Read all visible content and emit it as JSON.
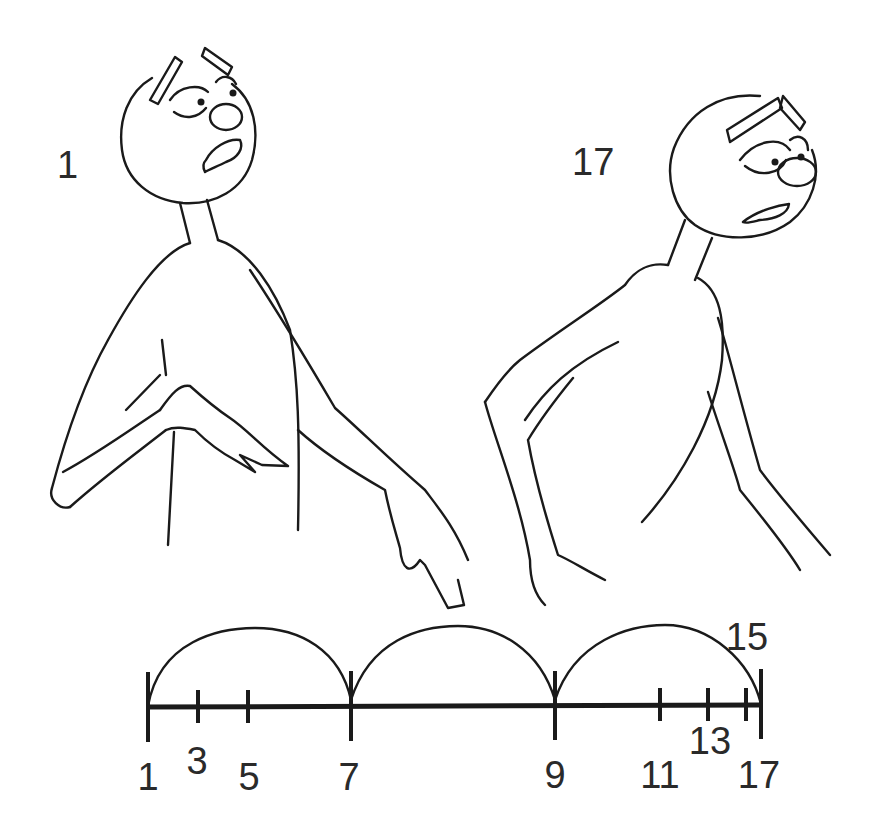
{
  "diagram": {
    "type": "animation-spacing-chart",
    "keyframes": [
      {
        "id": "key-start",
        "label": "1",
        "pose": "character looking up, worried, one hand at chest, other arm hanging"
      },
      {
        "id": "key-end",
        "label": "17",
        "pose": "character slumped forward, head tilted down, arms hanging"
      }
    ],
    "colors": {
      "ink": "#1a1a1a",
      "background": "#ffffff"
    }
  },
  "timeline": {
    "ticks": [
      {
        "label": "1",
        "frame": 1,
        "x": 148,
        "major": true
      },
      {
        "label": "3",
        "frame": 3,
        "x": 198,
        "major": false
      },
      {
        "label": "5",
        "frame": 5,
        "x": 248,
        "major": false
      },
      {
        "label": "7",
        "frame": 7,
        "x": 351,
        "major": true
      },
      {
        "label": "9",
        "frame": 9,
        "x": 555,
        "major": true
      },
      {
        "label": "11",
        "frame": 11,
        "x": 660,
        "major": false
      },
      {
        "label": "13",
        "frame": 13,
        "x": 708,
        "major": false
      },
      {
        "label": "15",
        "frame": 15,
        "x": 746,
        "major": false
      },
      {
        "label": "17",
        "frame": 17,
        "x": 761,
        "major": true
      }
    ],
    "arcs": [
      {
        "from": "1",
        "to": "7"
      },
      {
        "from": "7",
        "to": "9"
      },
      {
        "from": "9",
        "to": "17"
      }
    ]
  },
  "labels": {
    "key_start": "1",
    "key_end": "17",
    "t1": "1",
    "t3": "3",
    "t5": "5",
    "t7": "7",
    "t9": "9",
    "t11": "11",
    "t13": "13",
    "t15": "15",
    "t17": "17"
  }
}
